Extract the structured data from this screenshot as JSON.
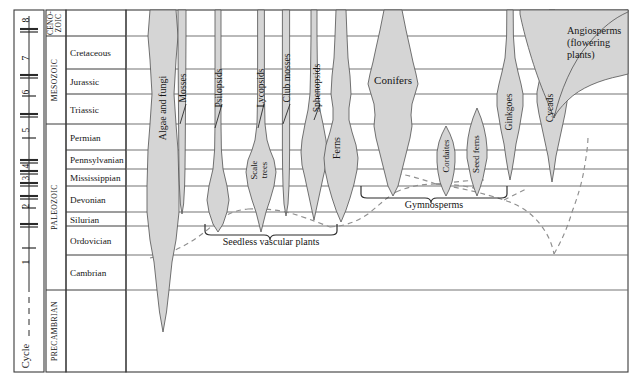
{
  "figure": {
    "width": 642,
    "height": 382,
    "background": "#ffffff",
    "line_color": "#3b3b3b",
    "grid_color": "#6d6d6d",
    "band_fill": "#d5d5d5",
    "band_stroke": "#5a5a5a",
    "dashed_color": "#8a8a8a"
  },
  "cycle_axis": {
    "label": "Cycle",
    "ticks": [
      "8",
      "7",
      "6",
      "5",
      "4",
      "3",
      "2",
      "1"
    ]
  },
  "eras": [
    {
      "name": "CENO-\nZOIC",
      "line1": "CENO-",
      "line2": "ZOIC",
      "top": 10,
      "bottom": 36
    },
    {
      "name": "MESOZOIC",
      "line1": "MESOZOIC",
      "line2": "",
      "top": 36,
      "bottom": 124
    },
    {
      "name": "PALEOZOIC",
      "line1": "PALEOZOIC",
      "line2": "",
      "top": 124,
      "bottom": 290
    },
    {
      "name": "PRECAMBRIAN",
      "line1": "PRECAMBRIAN",
      "line2": "",
      "top": 290,
      "bottom": 372
    }
  ],
  "periods": [
    {
      "name": "",
      "top": 10,
      "bottom": 36
    },
    {
      "name": "Cretaceous",
      "top": 36,
      "bottom": 69
    },
    {
      "name": "Jurassic",
      "top": 69,
      "bottom": 94
    },
    {
      "name": "Triassic",
      "top": 94,
      "bottom": 124
    },
    {
      "name": "Permian",
      "top": 124,
      "bottom": 150
    },
    {
      "name": "Pennsylvanian",
      "top": 150,
      "bottom": 169
    },
    {
      "name": "Mississippian",
      "top": 169,
      "bottom": 186
    },
    {
      "name": "Devonian",
      "top": 186,
      "bottom": 212
    },
    {
      "name": "Silurian",
      "top": 212,
      "bottom": 226
    },
    {
      "name": "Ordovician",
      "top": 226,
      "bottom": 255
    },
    {
      "name": "Cambrian",
      "top": 255,
      "bottom": 290
    },
    {
      "name": "",
      "top": 290,
      "bottom": 372
    }
  ],
  "chart_data": {
    "type": "area",
    "ylabel": "Geologic time",
    "xlabel": "Relative abundance",
    "grid": true,
    "legend": "none",
    "groups": [
      {
        "name": "Algae and fungi",
        "label_rotated": true,
        "first_appearance": "Precambrian",
        "peak": "Silurian-Devonian"
      },
      {
        "name": "Mosses",
        "label_rotated": true,
        "first_appearance": "Devonian",
        "peak": "Cenozoic"
      },
      {
        "name": "Psilopsids",
        "label_rotated": true,
        "first_appearance": "Silurian",
        "peak": "Devonian"
      },
      {
        "name": "Lycopsids",
        "label_rotated": true,
        "first_appearance": "Silurian",
        "peak": "Pennsylvanian"
      },
      {
        "name": "Scale trees",
        "label_rotated": true,
        "first_appearance": "Devonian",
        "peak": "Pennsylvanian"
      },
      {
        "name": "Club mosses",
        "label_rotated": true,
        "first_appearance": "Devonian",
        "peak": "Cenozoic"
      },
      {
        "name": "Sphenopsids",
        "label_rotated": true,
        "first_appearance": "Devonian",
        "peak": "Pennsylvanian"
      },
      {
        "name": "Ferns",
        "label_rotated": true,
        "first_appearance": "Devonian",
        "peak": "Pennsylvanian"
      },
      {
        "name": "Conifers",
        "label_rotated": false,
        "first_appearance": "Pennsylvanian",
        "peak": "Jurassic"
      },
      {
        "name": "Cordaites",
        "label_rotated": true,
        "first_appearance": "Mississippian",
        "peak": "Pennsylvanian"
      },
      {
        "name": "Seed ferns",
        "label_rotated": true,
        "first_appearance": "Devonian",
        "peak": "Pennsylvanian"
      },
      {
        "name": "Ginkgoes",
        "label_rotated": true,
        "first_appearance": "Permian",
        "peak": "Jurassic"
      },
      {
        "name": "Cycads",
        "label_rotated": true,
        "first_appearance": "Permian",
        "peak": "Jurassic"
      },
      {
        "name": "Angiosperms (flowering plants)",
        "label_rotated": false,
        "first_appearance": "Cretaceous",
        "peak": "Cenozoic"
      }
    ],
    "brackets": [
      {
        "label": "Seedless vascular plants",
        "x_start": 204,
        "x_end": 338,
        "y": 228
      },
      {
        "label": "Gymnosperms",
        "x_start": 360,
        "x_end": 508,
        "y": 186
      }
    ]
  },
  "labels": {
    "algae_and_fungi": "Algae and fungi",
    "mosses": "Mosses",
    "psilopsids": "Psilopsids",
    "lycopsids": "Lycopsids",
    "scale_trees_l1": "Scale",
    "scale_trees_l2": "trees",
    "club_mosses": "Club mosses",
    "sphenopsids": "Sphenopsids",
    "ferns": "Ferns",
    "conifers": "Conifers",
    "cordaites": "Cordaites",
    "seed_ferns": "Seed ferns",
    "ginkgoes": "Ginkgoes",
    "cycads": "Cycads",
    "angiosperms_l1": "Angiosperms",
    "angiosperms_l2": "(flowering",
    "angiosperms_l3": "plants)",
    "seedless_vascular_plants": "Seedless vascular plants",
    "gymnosperms": "Gymnosperms"
  }
}
